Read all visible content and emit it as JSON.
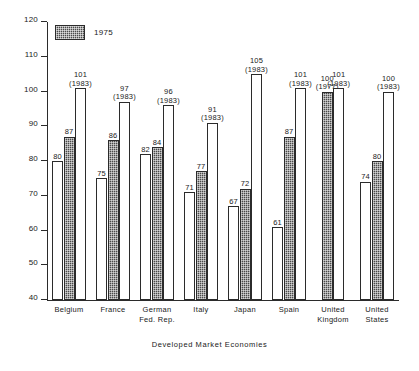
{
  "chart_data": {
    "type": "bar",
    "title": "",
    "xlabel": "Developed Market Economies",
    "ylabel": "",
    "ylim": [
      40,
      120
    ],
    "yticks": [
      40,
      50,
      60,
      70,
      80,
      90,
      100,
      110,
      120
    ],
    "grid": false,
    "legend": [
      {
        "label": "1975",
        "style": "hatched"
      }
    ],
    "legend_position": "top-left",
    "categories": [
      "Belgium",
      "France",
      "German Fed. Rep.",
      "Italy",
      "Japan",
      "Spain",
      "United Kingdom",
      "United States"
    ],
    "groups": [
      {
        "category": "Belgium",
        "label_lines": [
          "Belgium"
        ],
        "bars": [
          {
            "value": 80,
            "style": "open",
            "label": "80",
            "year": ""
          },
          {
            "value": 87,
            "style": "hatched",
            "label": "87",
            "year": ""
          },
          {
            "value": 101,
            "style": "open",
            "label": "101",
            "year": "(1983)"
          }
        ]
      },
      {
        "category": "France",
        "label_lines": [
          "France"
        ],
        "bars": [
          {
            "value": 75,
            "style": "open",
            "label": "75",
            "year": ""
          },
          {
            "value": 86,
            "style": "hatched",
            "label": "86",
            "year": ""
          },
          {
            "value": 97,
            "style": "open",
            "label": "97",
            "year": "(1983)"
          }
        ]
      },
      {
        "category": "German Fed. Rep.",
        "label_lines": [
          "German",
          "Fed. Rep."
        ],
        "bars": [
          {
            "value": 82,
            "style": "open",
            "label": "82",
            "year": ""
          },
          {
            "value": 84,
            "style": "hatched",
            "label": "84",
            "year": ""
          },
          {
            "value": 96,
            "style": "open",
            "label": "96",
            "year": "(1983)"
          }
        ]
      },
      {
        "category": "Italy",
        "label_lines": [
          "Italy"
        ],
        "bars": [
          {
            "value": 71,
            "style": "open",
            "label": "71",
            "year": ""
          },
          {
            "value": 77,
            "style": "hatched",
            "label": "77",
            "year": ""
          },
          {
            "value": 91,
            "style": "open",
            "label": "91",
            "year": "(1983)"
          }
        ]
      },
      {
        "category": "Japan",
        "label_lines": [
          "Japan"
        ],
        "bars": [
          {
            "value": 67,
            "style": "open",
            "label": "67",
            "year": ""
          },
          {
            "value": 72,
            "style": "hatched",
            "label": "72",
            "year": ""
          },
          {
            "value": 105,
            "style": "open",
            "label": "105",
            "year": "(1983)"
          }
        ]
      },
      {
        "category": "Spain",
        "label_lines": [
          "Spain"
        ],
        "bars": [
          {
            "value": 61,
            "style": "open",
            "label": "61",
            "year": ""
          },
          {
            "value": 87,
            "style": "hatched",
            "label": "87",
            "year": ""
          },
          {
            "value": 101,
            "style": "open",
            "label": "101",
            "year": "(1983)"
          }
        ]
      },
      {
        "category": "United Kingdom",
        "label_lines": [
          "United",
          "Kingdom"
        ],
        "bars": [
          {
            "value": 100,
            "style": "hatched",
            "label": "100",
            "year": "(1977)"
          },
          {
            "value": 101,
            "style": "open",
            "label": "101",
            "year": "(1983)"
          }
        ]
      },
      {
        "category": "United States",
        "label_lines": [
          "United",
          "States"
        ],
        "bars": [
          {
            "value": 74,
            "style": "open",
            "label": "74",
            "year": ""
          },
          {
            "value": 80,
            "style": "hatched",
            "label": "80",
            "year": ""
          },
          {
            "value": 100,
            "style": "open",
            "label": "100",
            "year": "(1983)"
          }
        ]
      }
    ],
    "colors": {
      "axis": "#2b2b2b",
      "hatched_bar": "#4a4a4a",
      "open_bar": "#ffffff",
      "background": "#ffffff"
    }
  }
}
